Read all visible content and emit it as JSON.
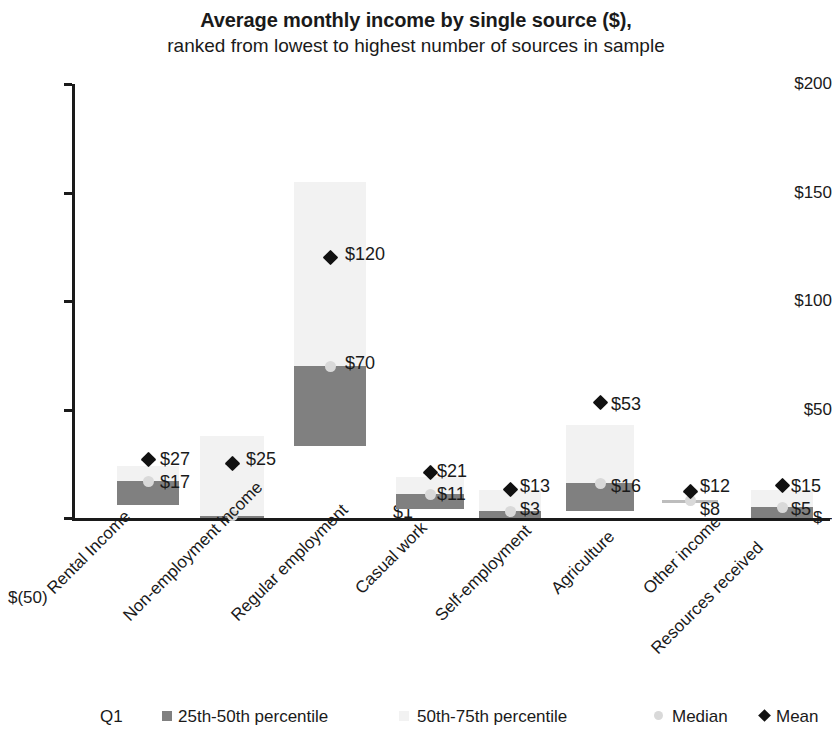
{
  "chart_data": {
    "type": "bar",
    "title": "Average monthly income by single source ($),",
    "subtitle": "ranked from lowest to highest number of sources in sample",
    "xlabel": "",
    "ylabel": "",
    "ylim": [
      -50,
      200
    ],
    "grid": false,
    "legend_position": "bottom",
    "y_ticks": [
      "$200",
      "$150",
      "$100",
      "$50",
      "$–",
      "$(50)"
    ],
    "y_tick_values": [
      200,
      150,
      100,
      50,
      0,
      -50
    ],
    "categories": [
      "Rental Income",
      "Non-employment income",
      "Regular employment",
      "Casual work",
      "Self-employment",
      "Agriculture",
      "Other income",
      "Resources received"
    ],
    "series": [
      {
        "name": "25th-50th percentile",
        "color": "#808080",
        "values": [
          6,
          0,
          33,
          4,
          0,
          3,
          8,
          0
        ]
      },
      {
        "name": "50th-75th percentile",
        "color": "#f2f2f2",
        "values": [
          24,
          38,
          155,
          19,
          13,
          43,
          8,
          13
        ]
      },
      {
        "name": "Median",
        "color": "#d9d9d9",
        "values": [
          17,
          1,
          70,
          11,
          3,
          16,
          8,
          5
        ],
        "labels": [
          "$17",
          "$1",
          "$70",
          "$11",
          "$3",
          "$16",
          "$8",
          "$5"
        ]
      },
      {
        "name": "Mean",
        "color": "#111111",
        "values": [
          27,
          25,
          120,
          21,
          13,
          53,
          12,
          15
        ],
        "labels": [
          "$27",
          "$25",
          "$120",
          "$21",
          "$13",
          "$53",
          "$12",
          "$15"
        ]
      }
    ]
  },
  "legend": {
    "q1_label": "Q1",
    "items": [
      {
        "label": "25th-50th percentile",
        "marker": "square-dark"
      },
      {
        "label": "50th-75th percentile",
        "marker": "square-light"
      },
      {
        "label": "Median",
        "marker": "circle-gray"
      },
      {
        "label": "Mean",
        "marker": "diamond-black"
      }
    ]
  }
}
